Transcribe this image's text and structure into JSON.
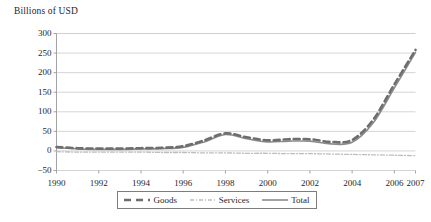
{
  "chart_data": {
    "type": "line",
    "title": "",
    "ylabel": "Billions of USD",
    "xlabel": "",
    "ylim": [
      -50,
      300
    ],
    "xlim": [
      1990,
      2007
    ],
    "grid": true,
    "legend_position": "bottom",
    "yticks": [
      300,
      250,
      200,
      150,
      100,
      50,
      0,
      -50
    ],
    "ytick_labels": [
      "300",
      "250",
      "200",
      "150",
      "100",
      "50",
      "0",
      "−50"
    ],
    "xticks": [
      1990,
      1992,
      1994,
      1996,
      1998,
      2000,
      2002,
      2004,
      2006,
      2007
    ],
    "xtick_labels": [
      "1990",
      "1992",
      "1994",
      "1996",
      "1998",
      "2000",
      "2002",
      "2004",
      "2006",
      "2007"
    ],
    "x": [
      1990,
      1991,
      1992,
      1993,
      1994,
      1995,
      1996,
      1997,
      1998,
      1999,
      2000,
      2001,
      2002,
      2003,
      2004,
      2005,
      2006,
      2007
    ],
    "series": [
      {
        "name": "Goods",
        "style": "dashed",
        "color": "#6e6e6e",
        "values": [
          10,
          7,
          6,
          6,
          7,
          8,
          12,
          27,
          45,
          35,
          27,
          30,
          30,
          23,
          28,
          80,
          170,
          258
        ]
      },
      {
        "name": "Services",
        "style": "dash-dot",
        "color": "#bdbdbd",
        "values": [
          -2,
          -3,
          -3,
          -3,
          -3,
          -4,
          -4,
          -5,
          -5,
          -6,
          -6,
          -7,
          -7,
          -8,
          -9,
          -10,
          -11,
          -12
        ]
      },
      {
        "name": "Total",
        "style": "solid",
        "color": "#8c8c8c",
        "values": [
          8,
          5,
          4,
          4,
          5,
          6,
          9,
          23,
          42,
          31,
          23,
          25,
          25,
          18,
          22,
          72,
          161,
          252
        ]
      }
    ]
  },
  "legend": {
    "items": [
      {
        "label": "Goods"
      },
      {
        "label": "Services"
      },
      {
        "label": "Total"
      }
    ]
  }
}
